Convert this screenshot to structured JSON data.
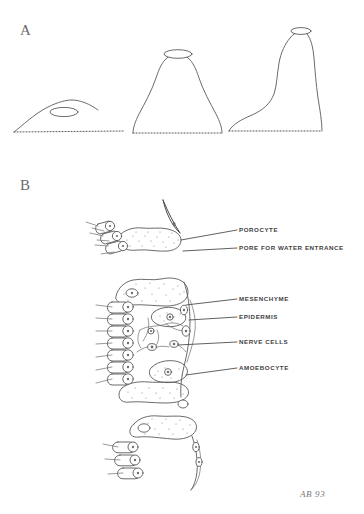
{
  "document": {
    "title": "Sponge body forms and body-wall cellular anatomy",
    "background_color": "#ffffff",
    "ink_color": "#5a5a5a",
    "label_color": "#3f3f3f",
    "signature": "AB 93",
    "medium": "hand-drawn pencil / ink diagram"
  },
  "panels": [
    {
      "letter": "A",
      "name": "sponge-body-forms",
      "caption": "",
      "figures": [
        {
          "name": "asconoid-low-dome",
          "description": "low flattened dome with single osculum at apex and dotted substrate base"
        },
        {
          "name": "syconoid-bell",
          "description": "tall bell / vase shaped body with wide osculum at apex and dotted substrate base"
        },
        {
          "name": "leuconoid-tall-vase",
          "description": "tall narrow tapering body with small osculum at apex, flaring foot and dotted substrate base"
        }
      ]
    },
    {
      "letter": "B",
      "name": "body-wall-cellular-detail",
      "caption": "",
      "labels": [
        {
          "id": "porocyte",
          "text": "POROCYTE"
        },
        {
          "id": "pore",
          "text": "PORE FOR WATER ENTRANCE"
        },
        {
          "id": "mesenchyme",
          "text": "MESENCHYME"
        },
        {
          "id": "epidermis",
          "text": "EPIDERMIS"
        },
        {
          "id": "nerve-cells",
          "text": "NERVE CELLS"
        },
        {
          "id": "amoebocyte",
          "text": "AMOEBOCYTE"
        }
      ]
    }
  ]
}
